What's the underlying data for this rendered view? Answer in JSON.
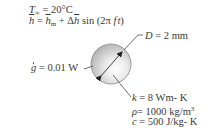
{
  "diagram": {
    "ambient": {
      "symbol": "T",
      "subscript": "∞",
      "equals": " = ",
      "value": "20°C"
    },
    "convection": {
      "lhs": "h",
      "equals": " = ",
      "mean": "h",
      "mean_subscript": "m",
      "plus": " + Δ",
      "delta_h": "h",
      "sin": " sin ",
      "paren_open": "(2π ",
      "f": "f",
      "t": "t",
      "paren_close": ")"
    },
    "generation": {
      "symbol": "g",
      "equals": " = ",
      "value": "0.01 W"
    },
    "diameter": {
      "symbol": "D",
      "equals": " = ",
      "value": "2 mm"
    },
    "properties": [
      {
        "symbol": "k",
        "equals": " = ",
        "value": "8 Wm- K",
        "superscript": ""
      },
      {
        "symbol": "ρ",
        "equals": "= ",
        "value": "1000 kg/m",
        "superscript": "3"
      },
      {
        "symbol": "c",
        "equals": " = ",
        "value": "500 J/kg- K",
        "superscript": ""
      }
    ],
    "colors": {
      "text": "#3a3a3a",
      "sphere_light": "#f2f2f2",
      "sphere_dark": "#9a9a9a",
      "line": "#4a4a4a"
    },
    "icons": {
      "sphere": "sphere-shape",
      "diameter_arrow": "double-arrow",
      "leader_lines": "leader-line"
    }
  }
}
